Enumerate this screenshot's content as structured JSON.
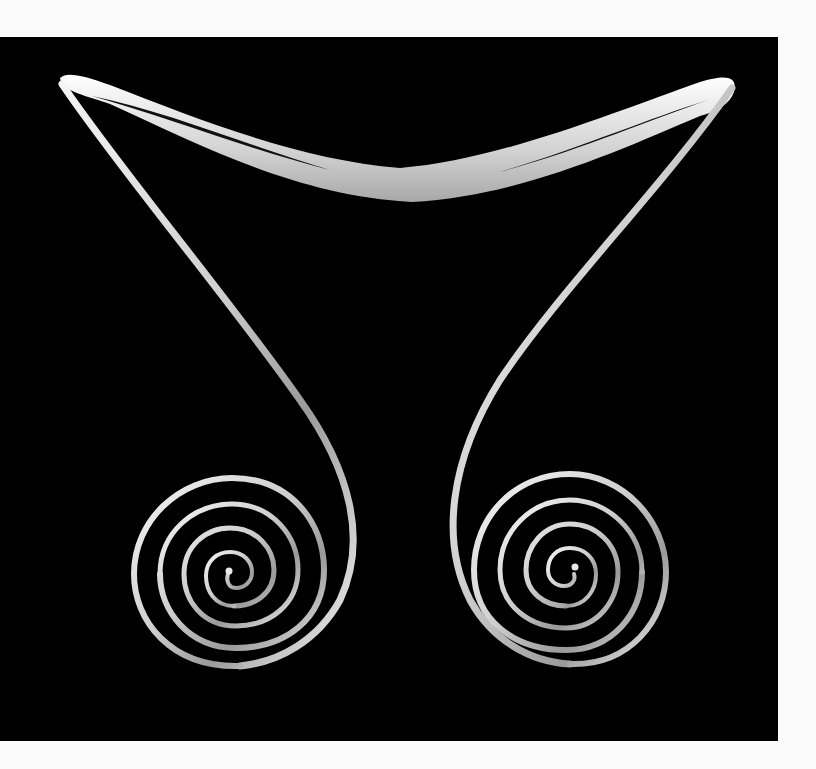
{
  "image": {
    "subject": "Silver neck ring with double spiral terminals on black background",
    "alt_text": "Sterling silver neck ring shaped like a curved boomerang collar with two long tapering arms ending in coiled spirals",
    "background_color": "#000000",
    "page_color": "#fbfbfb",
    "metal_color": "#d8d8d8",
    "highlight_color": "#ffffff",
    "shadow_color": "#7a7a7a"
  }
}
